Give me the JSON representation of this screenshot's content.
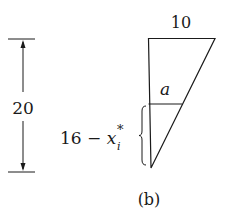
{
  "figure": {
    "caption": "(b)",
    "height_label": "20",
    "top_width_label": "10",
    "cross_section_label": "a",
    "depth_expr": {
      "base": "16 − x",
      "subscript": "i",
      "superscript": "*"
    }
  },
  "colors": {
    "stroke": "#1a1a1a",
    "background": "#ffffff"
  }
}
